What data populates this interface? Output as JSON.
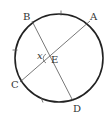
{
  "diagram": {
    "type": "circle-with-intersecting-chords",
    "circle": {
      "cx": 59,
      "cy": 58,
      "r": 44,
      "stroke": "#222222"
    },
    "chord_color": "#555555",
    "points": {
      "A": {
        "label": "A",
        "x": 90,
        "y": 21
      },
      "B": {
        "label": "B",
        "x": 32,
        "y": 21
      },
      "C": {
        "label": "C",
        "x": 20,
        "y": 82
      },
      "D": {
        "label": "D",
        "x": 73,
        "y": 101
      },
      "E": {
        "label": "E",
        "x": 51,
        "y": 58
      }
    },
    "chords": [
      {
        "from": "A",
        "to": "C"
      },
      {
        "from": "B",
        "to": "D"
      }
    ],
    "angle_label": "x",
    "tick_marks": [
      {
        "arc": "AB",
        "x": 61,
        "y": 13
      },
      {
        "arc": "BC",
        "x": 15,
        "y": 50
      },
      {
        "arc": "CD",
        "x": 42,
        "y": 100
      }
    ]
  }
}
